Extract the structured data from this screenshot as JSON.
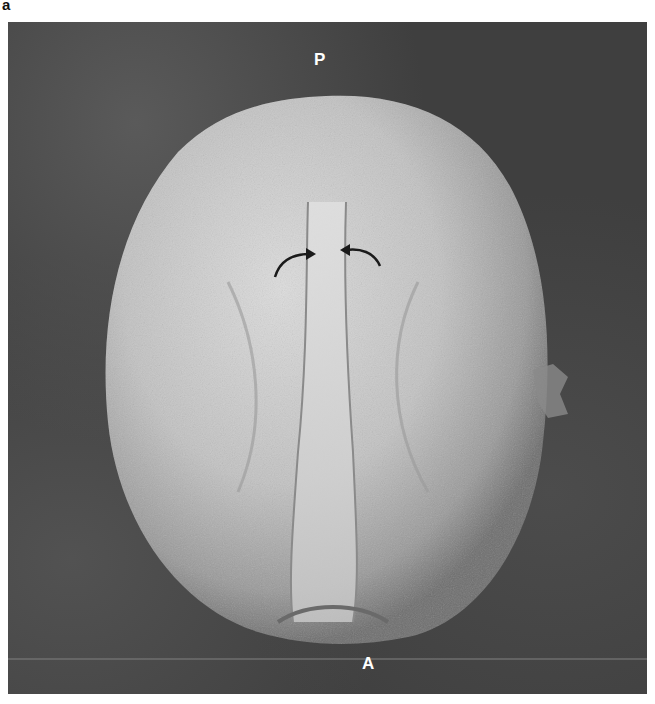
{
  "figure": {
    "panel_label": "a",
    "labels": {
      "top_pole": "P",
      "bottom_pole": "A"
    },
    "annotations": [
      {
        "type": "curved-arrow",
        "direction": "right",
        "target": "furrow"
      },
      {
        "type": "curved-arrow",
        "direction": "left",
        "target": "furrow"
      }
    ],
    "colors": {
      "background": "#3f3f3f",
      "specimen_light": "#d8d8d8",
      "specimen_mid": "#a8a8a8",
      "label": "#ffffff",
      "arrow": "#1a1a1a"
    }
  }
}
